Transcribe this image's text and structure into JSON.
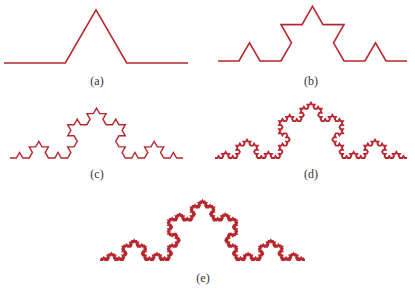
{
  "figure": {
    "stroke_color": "#b8272e",
    "panels": [
      {
        "id": "a",
        "label": "(a)",
        "iteration": 1,
        "x0": 4,
        "x1": 188,
        "baseline_y": 63,
        "stroke_width": 1.6,
        "label_x": 97,
        "label_y": 74
      },
      {
        "id": "b",
        "label": "(b)",
        "iteration": 2,
        "x0": 218,
        "x1": 407,
        "baseline_y": 61,
        "stroke_width": 1.6,
        "label_x": 311,
        "label_y": 74
      },
      {
        "id": "c",
        "label": "(c)",
        "iteration": 3,
        "x0": 10,
        "x1": 183,
        "baseline_y": 158,
        "stroke_width": 1.4,
        "label_x": 97,
        "label_y": 167
      },
      {
        "id": "d",
        "label": "(d)",
        "iteration": 4,
        "x0": 215,
        "x1": 407,
        "baseline_y": 158,
        "stroke_width": 1.8,
        "label_x": 311,
        "label_y": 167
      },
      {
        "id": "e",
        "label": "(e)",
        "iteration": 5,
        "x0": 100,
        "x1": 305,
        "baseline_y": 260,
        "stroke_width": 2.0,
        "label_x": 203,
        "label_y": 271
      }
    ]
  }
}
